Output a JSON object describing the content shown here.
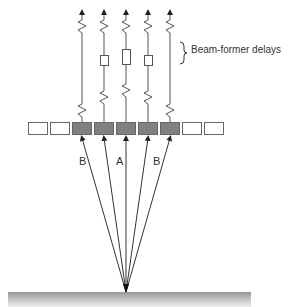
{
  "diagram": {
    "title": "",
    "caption": "Beam-former delays",
    "labels": {
      "beam_left": "B",
      "beam_center": "A",
      "beam_right": "B"
    },
    "elements": {
      "count": 9,
      "active": [
        false,
        false,
        true,
        true,
        true,
        true,
        true,
        false,
        false
      ]
    },
    "channels": [
      {
        "delay": "none"
      },
      {
        "delay": "short"
      },
      {
        "delay": "long"
      },
      {
        "delay": "short"
      },
      {
        "delay": "none"
      }
    ],
    "colors": {
      "active_element": "#7f7f7f",
      "inactive_element": "#ffffff",
      "line": "#555555",
      "surface_top": "#9a9a9a",
      "surface_bottom": "#f2f2f2"
    }
  }
}
